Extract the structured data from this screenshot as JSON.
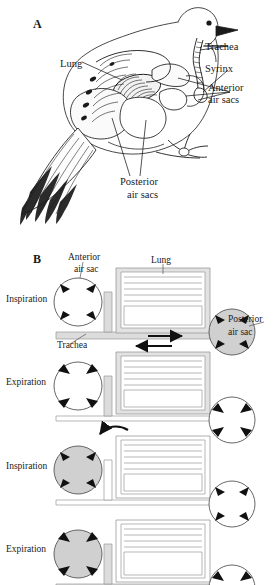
{
  "figure": {
    "type": "two-panel biology diagram"
  },
  "panel_a": {
    "letter": "A",
    "description": "Lateral cutaway drawing of a perched bird showing lungs, trachea, syrinx and air sacs",
    "labels": [
      {
        "id": "lung",
        "text": "Lung",
        "x": 60,
        "y": 64,
        "align": "left"
      },
      {
        "id": "trachea",
        "text": "Trachea",
        "x": 205,
        "y": 48,
        "align": "left"
      },
      {
        "id": "syrinx",
        "text": "Syrinx",
        "x": 205,
        "y": 70,
        "align": "left"
      },
      {
        "id": "anterior-air-sacs-line1",
        "text": "Anterior",
        "x": 208,
        "y": 88,
        "align": "left"
      },
      {
        "id": "anterior-air-sacs-line2",
        "text": "air sacs",
        "x": 208,
        "y": 100,
        "align": "left"
      },
      {
        "id": "posterior-air-sacs-line1",
        "text": "Posterior",
        "x": 120,
        "y": 182,
        "align": "left"
      },
      {
        "id": "posterior-air-sacs-line2",
        "text": "air sacs",
        "x": 126,
        "y": 195,
        "align": "left"
      }
    ]
  },
  "panel_b": {
    "letter": "B",
    "description": "Four-step schematic of the two-cycle airflow through bird lungs and air sacs",
    "labels": [
      {
        "id": "anterior-air-sac-line1",
        "text": "Anterior",
        "x": 68,
        "y": 259,
        "align": "left"
      },
      {
        "id": "anterior-air-sac-line2",
        "text": "air sac",
        "x": 73,
        "y": 271,
        "align": "left"
      },
      {
        "id": "lung",
        "text": "Lung",
        "x": 153,
        "y": 262,
        "align": "left"
      },
      {
        "id": "trachea",
        "text": "Trachea",
        "x": 57,
        "y": 339,
        "align": "left"
      },
      {
        "id": "posterior-air-sac-line1",
        "text": "Posterior",
        "x": 228,
        "y": 313,
        "align": "left"
      },
      {
        "id": "posterior-air-sac-line2",
        "text": "air sac",
        "x": 228,
        "y": 326,
        "align": "left"
      }
    ],
    "stages": [
      {
        "id": "stage-1",
        "label": "Inspiration",
        "label_x": 6,
        "label_y": 300,
        "anterior_sac_filled": false,
        "posterior_sac_filled": true,
        "anterior_arrows": "outward",
        "posterior_arrows": "outward",
        "flow_arrow": "right",
        "flow_arrow_location": "trachea",
        "lung_shaded": true,
        "description": "Air enters trachea and fills the posterior air sacs"
      },
      {
        "id": "stage-2",
        "label": "Expiration",
        "label_x": 6,
        "label_y": 382,
        "anterior_sac_filled": false,
        "posterior_sac_filled": false,
        "anterior_arrows": "inward",
        "posterior_arrows": "inward",
        "flow_arrow": "left",
        "flow_arrow_location": "above-lung",
        "lung_shaded": true,
        "description": "Air moves from posterior air sacs into the lung"
      },
      {
        "id": "stage-3",
        "label": "Inspiration",
        "label_x": 6,
        "label_y": 466,
        "anterior_sac_filled": true,
        "posterior_sac_filled": false,
        "anterior_arrows": "outward",
        "posterior_arrows": "outward",
        "flow_arrow": "curve-into-anterior",
        "flow_arrow_location": "lung-to-anterior",
        "lung_shaded": false,
        "description": "Air from the lung moves into the anterior air sacs"
      },
      {
        "id": "stage-4",
        "label": "Expiration",
        "label_x": 6,
        "label_y": 548,
        "anterior_sac_filled": true,
        "posterior_sac_filled": false,
        "anterior_arrows": "inward",
        "posterior_arrows": "inward",
        "flow_arrow": "left",
        "flow_arrow_location": "trachea",
        "lung_shaded": false,
        "description": "Air leaves the anterior air sacs through the trachea"
      }
    ]
  },
  "colors": {
    "ink": "#1a1a1a",
    "fill_shade": "#d0d0d0",
    "tube_shade": "#dcdcdc",
    "background": "#ffffff"
  }
}
